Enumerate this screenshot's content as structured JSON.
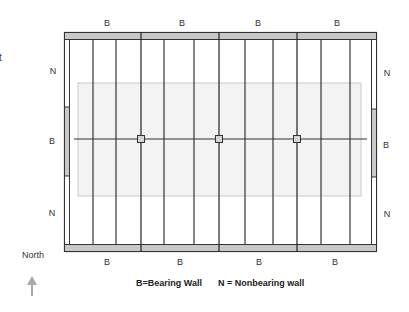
{
  "diagram": {
    "type": "floor-framing-plan",
    "frame": {
      "left": 64,
      "top": 32,
      "right": 377,
      "bottom": 252,
      "wall_thickness_tb": 8,
      "wall_thickness_lr": 6
    },
    "inner_area": {
      "x": 78,
      "y": 83,
      "w": 283,
      "h": 113
    },
    "beam": {
      "y": 139,
      "x1": 74,
      "x2": 367,
      "posts_x": [
        141,
        219,
        297
      ]
    },
    "joists_x": [
      93,
      116,
      141,
      164,
      194,
      218,
      245,
      273,
      297,
      321,
      350
    ],
    "major_joists_x": [
      141,
      219,
      297
    ],
    "side_bearing_segment": {
      "left": {
        "y1": 107,
        "y2": 176
      },
      "right": {
        "y1": 109,
        "y2": 177
      }
    },
    "colors": {
      "wall_fill": "#c8c8c8",
      "wall_stroke": "#333333",
      "joist": "#222222",
      "inner_area_fill": "#f3f3f3",
      "inner_area_stroke": "#c9c9c9",
      "arrow": "#a8a8a8"
    }
  },
  "labels": {
    "top": [
      {
        "text": "B",
        "x": 107,
        "y": 23
      },
      {
        "text": "B",
        "x": 182,
        "y": 23
      },
      {
        "text": "B",
        "x": 258,
        "y": 23
      },
      {
        "text": "B",
        "x": 337,
        "y": 23
      }
    ],
    "bottom": [
      {
        "text": "B",
        "x": 107,
        "y": 262
      },
      {
        "text": "B",
        "x": 180,
        "y": 262
      },
      {
        "text": "B",
        "x": 259,
        "y": 262
      },
      {
        "text": "B",
        "x": 335,
        "y": 262
      }
    ],
    "left": [
      {
        "text": "N",
        "x": 53,
        "y": 71
      },
      {
        "text": "B",
        "x": 52,
        "y": 141
      },
      {
        "text": "N",
        "x": 52,
        "y": 213
      }
    ],
    "right": [
      {
        "text": "N",
        "x": 387,
        "y": 73
      },
      {
        "text": "B",
        "x": 386,
        "y": 145
      },
      {
        "text": "N",
        "x": 387,
        "y": 214
      }
    ]
  },
  "north_indicator": {
    "label": "North",
    "arrow": "up-arrow-icon"
  },
  "legend": {
    "bearing": "B=Bearing Wall",
    "nonbearing": "N = Nonbearing wall"
  },
  "cutoff_text": "t"
}
